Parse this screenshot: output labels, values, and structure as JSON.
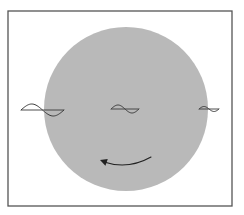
{
  "diagram": {
    "width": 244,
    "height": 215,
    "colors": {
      "background": "#ffffff",
      "frame": "#555555",
      "disk": "#b9b9b9",
      "line": "#3a3a3a",
      "arrow": "#222222"
    },
    "frame": {
      "x": 8,
      "y": 11,
      "width": 224,
      "height": 195
    },
    "disk": {
      "cx": 126,
      "cy": 109,
      "r": 82
    },
    "waves": [
      {
        "name": "wave-left",
        "x": 21,
        "y": 110,
        "length": 43,
        "amplitude": 6,
        "cycles": 1
      },
      {
        "name": "wave-center",
        "x": 111,
        "y": 109,
        "length": 28,
        "amplitude": 4,
        "cycles": 1
      },
      {
        "name": "wave-right",
        "x": 199,
        "y": 109,
        "length": 20,
        "amplitude": 2.5,
        "cycles": 1
      }
    ],
    "rotation_arrow": {
      "start": [
        151,
        157
      ],
      "control": [
        128,
        170
      ],
      "end": [
        100,
        160
      ],
      "direction": "counter-clockwise"
    }
  }
}
